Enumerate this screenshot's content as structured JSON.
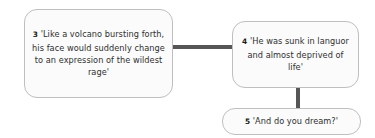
{
  "diagram": {
    "type": "flowchart",
    "background_color": "#ffffff",
    "node_fill_color": "#fbfbfb",
    "node_border_color": "#bfbfbf",
    "connector_color": "#565656",
    "text_color": "#2f2f2f",
    "nodes": [
      {
        "id": "node-3",
        "number": "3",
        "text": "'Like a volcano bursting forth, his face would suddenly change to an expression of the wildest rage'"
      },
      {
        "id": "node-4",
        "number": "4",
        "text": "'He was sunk in languor and almost deprived of life'"
      },
      {
        "id": "node-5",
        "number": "5",
        "text": "'And do you dream?'"
      }
    ],
    "connectors": [
      {
        "id": "conn-1-2",
        "from": "node-3",
        "to": "node-4",
        "orientation": "horizontal"
      },
      {
        "id": "conn-2-3",
        "from": "node-4",
        "to": "node-5",
        "orientation": "vertical"
      }
    ]
  }
}
